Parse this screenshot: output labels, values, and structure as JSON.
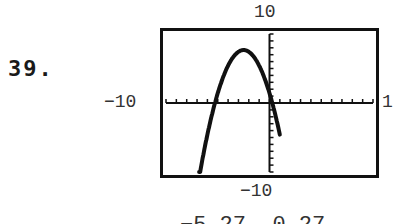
{
  "problem": {
    "number": "39."
  },
  "window_labels": {
    "ymax": "10",
    "xmin": "−10",
    "xmax": "1",
    "ymin": "−10"
  },
  "answer": {
    "text": "−5.27, 0.27"
  },
  "colors": {
    "ink": "#111111",
    "label": "#333333",
    "background": "#ffffff"
  },
  "chart_data": {
    "type": "line",
    "title": "",
    "xlabel": "",
    "ylabel": "",
    "xlim": [
      -10,
      10
    ],
    "ylim": [
      -10,
      10
    ],
    "xscale_ticks": 1,
    "yscale_ticks": 1,
    "grid": false,
    "axes_visible": true,
    "series": [
      {
        "name": "y = -x^2 - 5x + 1.42",
        "x": [
          -6.8,
          -6,
          -5.27,
          -4.5,
          -4,
          -3.5,
          -3,
          -2.5,
          -2,
          -1.5,
          -1,
          -0.5,
          0,
          0.27,
          1.0
        ],
        "y": [
          -10,
          -4.58,
          0,
          3.67,
          5.42,
          6.67,
          7.42,
          7.67,
          7.42,
          6.67,
          5.42,
          3.67,
          1.42,
          0,
          -4.58
        ]
      }
    ],
    "annotations": [
      "roots ≈ −5.27 and 0.27"
    ]
  }
}
